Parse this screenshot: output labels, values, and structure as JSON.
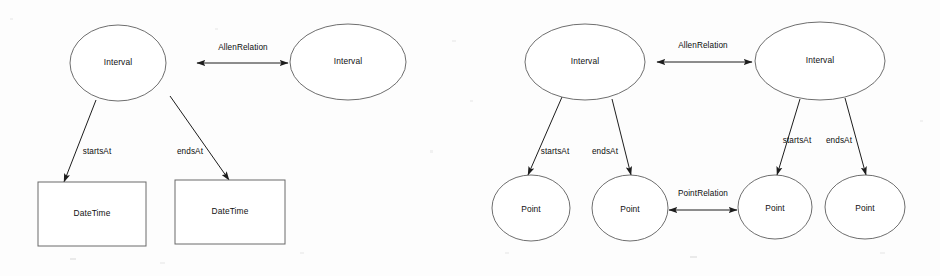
{
  "figure": {
    "kind": "uml-style entity relationship diagram",
    "background_color": "#fdfdfd",
    "stroke_color": "#1d1d1d",
    "node_outline_color": "#5d5d5d",
    "text_color": "#101010",
    "panels": [
      {
        "id": "left-panel",
        "name": "interval-datetime-diagram",
        "nodes": [
          {
            "id": "l-interval-1",
            "label": "Interval",
            "shape": "ellipse",
            "cx": 118,
            "cy": 63,
            "rx": 48,
            "ry": 38
          },
          {
            "id": "l-interval-2",
            "label": "Interval",
            "shape": "ellipse",
            "cx": 348,
            "cy": 62,
            "rx": 58,
            "ry": 38
          },
          {
            "id": "l-datetime-1",
            "label": "DateTime",
            "shape": "rect",
            "x": 38,
            "y": 182,
            "w": 108,
            "h": 64
          },
          {
            "id": "l-datetime-2",
            "label": "DateTime",
            "shape": "rect",
            "x": 175,
            "y": 180,
            "w": 110,
            "h": 64
          }
        ],
        "edges": [
          {
            "id": "l-allen",
            "label": "AllenRelation",
            "style": "double-arrow",
            "x1": 197,
            "y1": 63,
            "x2": 288,
            "y2": 63,
            "label_x": 243,
            "label_y": 48
          },
          {
            "id": "l-startsat",
            "label": "startsAt",
            "style": "single-arrow",
            "x1": 96,
            "y1": 100,
            "x2": 64,
            "y2": 182,
            "label_x": 97,
            "label_y": 152
          },
          {
            "id": "l-endsat",
            "label": "endsAt",
            "style": "single-arrow",
            "x1": 170,
            "y1": 96,
            "x2": 229,
            "y2": 180,
            "label_x": 190,
            "label_y": 152
          }
        ]
      },
      {
        "id": "right-panel",
        "name": "interval-point-diagram",
        "nodes": [
          {
            "id": "r-interval-1",
            "label": "Interval",
            "shape": "ellipse",
            "cx": 585,
            "cy": 62,
            "rx": 60,
            "ry": 38
          },
          {
            "id": "r-interval-2",
            "label": "Interval",
            "shape": "ellipse",
            "cx": 820,
            "cy": 61,
            "rx": 65,
            "ry": 39
          },
          {
            "id": "r-point-1",
            "label": "Point",
            "shape": "ellipse",
            "cx": 531,
            "cy": 208,
            "rx": 39,
            "ry": 33
          },
          {
            "id": "r-point-2",
            "label": "Point",
            "shape": "ellipse",
            "cx": 630,
            "cy": 208,
            "rx": 38,
            "ry": 33
          },
          {
            "id": "r-point-3",
            "label": "Point",
            "shape": "ellipse",
            "cx": 775,
            "cy": 207,
            "rx": 37,
            "ry": 32
          },
          {
            "id": "r-point-4",
            "label": "Point",
            "shape": "ellipse",
            "cx": 865,
            "cy": 207,
            "rx": 40,
            "ry": 32
          }
        ],
        "edges": [
          {
            "id": "r-allen",
            "label": "AllenRelation",
            "style": "double-arrow",
            "x1": 657,
            "y1": 62,
            "x2": 752,
            "y2": 62,
            "label_x": 703,
            "label_y": 46
          },
          {
            "id": "r-pointrel",
            "label": "PointRelation",
            "style": "double-arrow",
            "x1": 669,
            "y1": 210,
            "x2": 737,
            "y2": 210,
            "label_x": 703,
            "label_y": 194
          },
          {
            "id": "r-startsat-1",
            "label": "startsAt",
            "style": "single-arrow",
            "x1": 562,
            "y1": 97,
            "x2": 528,
            "y2": 175,
            "label_x": 555,
            "label_y": 152
          },
          {
            "id": "r-endsat-1",
            "label": "endsAt",
            "style": "single-arrow",
            "x1": 612,
            "y1": 99,
            "x2": 631,
            "y2": 175,
            "label_x": 605,
            "label_y": 152
          },
          {
            "id": "r-startsat-2",
            "label": "startsAt",
            "style": "single-arrow",
            "x1": 800,
            "y1": 99,
            "x2": 777,
            "y2": 175,
            "label_x": 797,
            "label_y": 141
          },
          {
            "id": "r-endsat-2",
            "label": "endsAt",
            "style": "single-arrow",
            "x1": 845,
            "y1": 98,
            "x2": 866,
            "y2": 175,
            "label_x": 839,
            "label_y": 141
          }
        ]
      }
    ]
  }
}
